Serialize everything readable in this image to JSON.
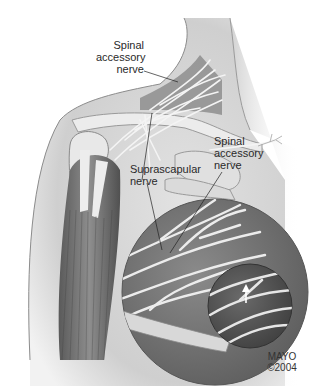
{
  "figure": {
    "labels": {
      "spinal_accessory_top": [
        "Spinal",
        "accessory",
        "nerve"
      ],
      "spinal_accessory_right": [
        "Spinal",
        "accessory",
        "nerve"
      ],
      "suprascapular": [
        "Suprascapular",
        "nerve"
      ]
    },
    "credit": [
      "MAYO",
      "©2004"
    ],
    "colors": {
      "background": "#ffffff",
      "skin": "#d9d9d9",
      "muscle_dark": "#6a6a6a",
      "muscle_mid": "#8a8a8a",
      "nerve": "#eeeeee",
      "magnifier": "#7c7c7c",
      "bone": "#e6e6e6"
    }
  }
}
